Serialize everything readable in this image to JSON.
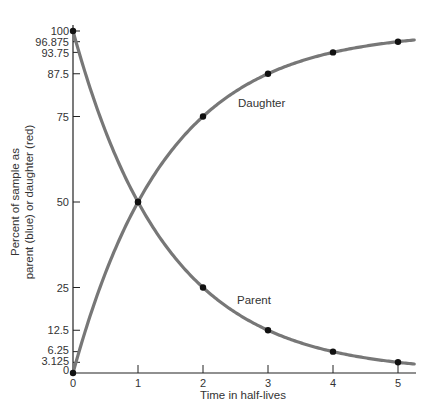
{
  "chart_data": {
    "type": "line",
    "title": "",
    "xlabel": "Time in half-lives",
    "ylabel_lines": [
      "Percent of sample as",
      "parent (blue) or daughter (red)"
    ],
    "xlim": [
      0,
      5.25
    ],
    "ylim": [
      0,
      100
    ],
    "x_ticks": [
      0,
      1,
      2,
      3,
      4,
      5
    ],
    "x_tick_labels": [
      "0",
      "1",
      "2",
      "3",
      "4",
      "5"
    ],
    "y_ticks": [
      0,
      3.125,
      6.25,
      12.5,
      25,
      50,
      75,
      87.5,
      93.75,
      96.875,
      100
    ],
    "y_tick_labels": [
      "0",
      "3.125",
      "6.25",
      "12.5",
      "25",
      "50",
      "75",
      "87.5",
      "93.75",
      "96.875",
      "100"
    ],
    "grid": false,
    "series": [
      {
        "name": "Parent",
        "label": "Parent",
        "color": "#777777",
        "function": "100 * 0.5^x",
        "x": [
          0,
          1,
          2,
          3,
          4,
          5
        ],
        "values": [
          100,
          50,
          25,
          12.5,
          6.25,
          3.125
        ]
      },
      {
        "name": "Daughter",
        "label": "Daughter",
        "color": "#777777",
        "function": "100 - 100 * 0.5^x",
        "x": [
          0,
          1,
          2,
          3,
          4,
          5
        ],
        "values": [
          0,
          50,
          75,
          87.5,
          93.75,
          96.875
        ]
      }
    ],
    "marker_color": "#111111"
  }
}
